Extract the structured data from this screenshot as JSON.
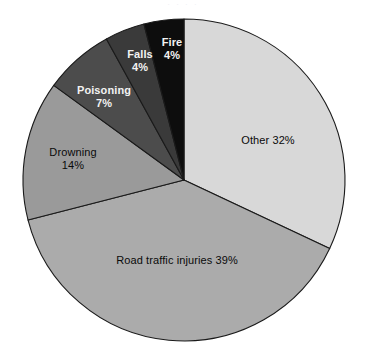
{
  "chart_data": {
    "type": "pie",
    "title": "",
    "subtitle": "",
    "xlabel": "",
    "ylabel": "",
    "legend_position": "none",
    "grid": false,
    "start_angle_deg": 0,
    "direction": "clockwise",
    "units": "percent",
    "categories": [
      "Other",
      "Road traffic injuries",
      "Drowning",
      "Poisoning",
      "Falls",
      "Fire"
    ],
    "values": [
      32,
      39,
      14,
      7,
      4,
      4
    ],
    "slices": [
      {
        "name": "Other",
        "label_name": "Other",
        "value": 32,
        "value_label": "32%",
        "full_label": "Other 32%",
        "color": "#d8d8d8",
        "text_color": "#0a0a0a",
        "start_deg": 0,
        "end_deg": 115.2
      },
      {
        "name": "Road traffic injuries",
        "label_name": "Road traffic injuries",
        "value": 39,
        "value_label": "39%",
        "full_label": "Road traffic injuries 39%",
        "color": "#ababab",
        "text_color": "#0a0a0a",
        "start_deg": 115.2,
        "end_deg": 255.6
      },
      {
        "name": "Drowning",
        "label_name": "Drowning",
        "value": 14,
        "value_label": "14%",
        "full_label": "Drowning 14%",
        "color": "#9a9a9a",
        "text_color": "#0a0a0a",
        "start_deg": 255.6,
        "end_deg": 306.0
      },
      {
        "name": "Poisoning",
        "label_name": "Poisoning",
        "value": 7,
        "value_label": "7%",
        "full_label": "Poisoning 7%",
        "color": "#4c4c4c",
        "text_color": "#f2f2f2",
        "start_deg": 306.0,
        "end_deg": 331.2
      },
      {
        "name": "Falls",
        "label_name": "Falls",
        "value": 4,
        "value_label": "4%",
        "full_label": "Falls 4%",
        "color": "#3a3a3a",
        "text_color": "#f2f2f2",
        "start_deg": 331.2,
        "end_deg": 345.6
      },
      {
        "name": "Fire",
        "label_name": "Fire",
        "value": 4,
        "value_label": "4%",
        "full_label": "Fire 4%",
        "color": "#0d0d0d",
        "text_color": "#f2f2f2",
        "start_deg": 345.6,
        "end_deg": 360.0
      }
    ],
    "geometry": {
      "center_x": 184,
      "center_y": 180,
      "radius": 161
    },
    "outline_color": "#1a1a1a",
    "background_color": "#ffffff"
  },
  "artifacts": {
    "top_cropped_text": "·  ·  ·     ·"
  }
}
